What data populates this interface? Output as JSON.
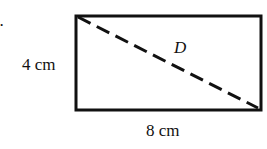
{
  "problem": {
    "number_label": "8.",
    "shape": "rectangle",
    "width_label": "8 cm",
    "height_label": "4 cm",
    "diagonal_label": "D",
    "stroke_color": "#111111"
  }
}
